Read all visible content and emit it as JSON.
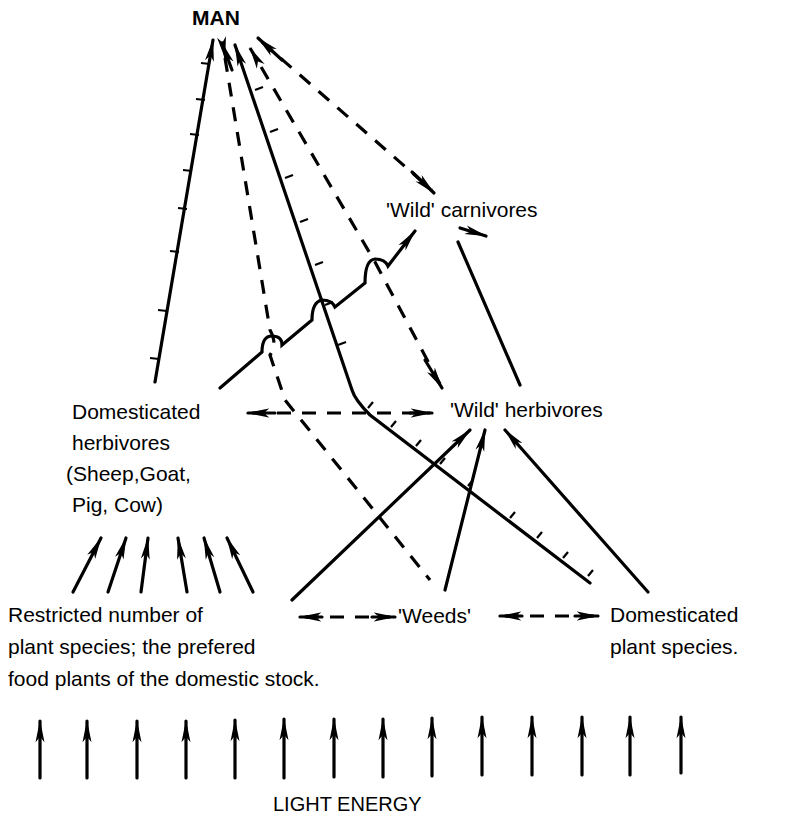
{
  "diagram": {
    "type": "food-web",
    "nodes": {
      "man": "MAN",
      "wild_carnivores": "'Wild' carnivores",
      "wild_herbivores": "'Wild' herbivores",
      "domesticated_herbivores": [
        "Domesticated",
        "herbivores",
        "(Sheep,Goat,",
        "Pig, Cow)"
      ],
      "restricted_plants": [
        "Restricted number of",
        "plant species; the prefered",
        "food plants of the domestic stock."
      ],
      "weeds": "'Weeds'",
      "domesticated_plants": [
        "Domesticated",
        "plant species."
      ],
      "light_energy": "LIGHT ENERGY"
    },
    "legend_hints": {
      "solid_line": "direct feeding link",
      "dashed_line": "indirect / interaction link",
      "ticked_line": "managed (human-controlled) link"
    },
    "edges": [
      {
        "from": "domesticated_herbivores",
        "to": "man",
        "style": "solid-ticked"
      },
      {
        "from": "weeds",
        "to": "man",
        "style": "dashed"
      },
      {
        "from": "domesticated_plants",
        "to": "man",
        "style": "solid-ticked"
      },
      {
        "from": "wild_herbivores",
        "to": "man",
        "style": "dashed"
      },
      {
        "from": "man",
        "to": "wild_carnivores",
        "style": "dashed-bidirectional"
      },
      {
        "from": "domesticated_herbivores",
        "to": "wild_carnivores",
        "style": "solid"
      },
      {
        "from": "wild_herbivores",
        "to": "wild_carnivores",
        "style": "solid"
      },
      {
        "from": "domesticated_herbivores",
        "to": "wild_herbivores",
        "style": "dashed-bidirectional"
      },
      {
        "from": "restricted_plants",
        "to": "domesticated_herbivores",
        "style": "solid",
        "count": 6
      },
      {
        "from": "restricted_plants",
        "to": "wild_herbivores",
        "style": "solid"
      },
      {
        "from": "weeds",
        "to": "wild_herbivores",
        "style": "solid"
      },
      {
        "from": "domesticated_plants",
        "to": "wild_herbivores",
        "style": "solid"
      },
      {
        "from": "restricted_plants",
        "to": "weeds",
        "style": "dashed-bidirectional"
      },
      {
        "from": "weeds",
        "to": "domesticated_plants",
        "style": "dashed-bidirectional"
      },
      {
        "from": "light_energy",
        "to": "plants",
        "style": "solid",
        "count": 14
      }
    ]
  }
}
